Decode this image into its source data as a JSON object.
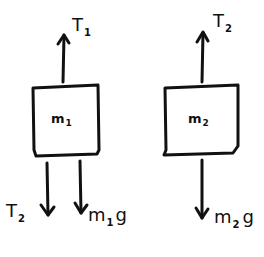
{
  "diagram": {
    "type": "free-body-diagram",
    "stroke_color": "#111111",
    "background": "#ffffff",
    "bodies": [
      {
        "id": "m1",
        "label_main": "m",
        "label_sub": "1",
        "forces": [
          {
            "direction": "up",
            "label_main": "T",
            "label_sub": "1"
          },
          {
            "direction": "down",
            "label_main": "T",
            "label_sub": "2"
          },
          {
            "direction": "down",
            "label_main": "m",
            "label_sub": "1",
            "label_tail": "g"
          }
        ]
      },
      {
        "id": "m2",
        "label_main": "m",
        "label_sub": "2",
        "forces": [
          {
            "direction": "up",
            "label_main": "T",
            "label_sub": "2"
          },
          {
            "direction": "down",
            "label_main": "m",
            "label_sub": "2",
            "label_tail": "g"
          }
        ]
      }
    ]
  }
}
